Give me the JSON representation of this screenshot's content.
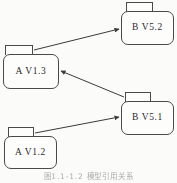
{
  "figure": {
    "kind": "uml-package-dependency-diagram",
    "background_color": "#fbfbfa",
    "line_color": "#4a4a4a",
    "node_fill_color": "#fdfdfc",
    "text_color": "#2b2b2b",
    "caption": "图1.1-1.2  模型引用关系"
  },
  "nodes": [
    {
      "id": "b-v52",
      "label": "B V5.2",
      "x": 121,
      "y": 11,
      "width": 53,
      "height": 34
    },
    {
      "id": "a-v13",
      "label": "A V1.3",
      "x": 3,
      "y": 54,
      "width": 56,
      "height": 35
    },
    {
      "id": "b-v51",
      "label": "B V5.1",
      "x": 121,
      "y": 101,
      "width": 53,
      "height": 34
    },
    {
      "id": "a-v12",
      "label": "A V1.2",
      "x": 4,
      "y": 136,
      "width": 53,
      "height": 33
    }
  ],
  "edges": [
    {
      "id": "edge-a13-to-b52",
      "from": "a-v13",
      "to": "b-v52",
      "arrowhead": "filled-triangle",
      "x1": 34,
      "y1": 50,
      "x2": 119,
      "y2": 29
    },
    {
      "id": "edge-b51-to-a13",
      "from": "b-v51",
      "to": "a-v13",
      "arrowhead": "filled-triangle",
      "x1": 124,
      "y1": 97,
      "x2": 61,
      "y2": 71
    },
    {
      "id": "edge-a12-to-b51",
      "from": "a-v12",
      "to": "b-v51",
      "arrowhead": "filled-triangle",
      "x1": 35,
      "y1": 133,
      "x2": 119,
      "y2": 117
    }
  ]
}
